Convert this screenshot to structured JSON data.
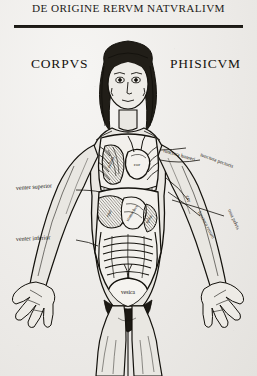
{
  "page": {
    "running_head": "DE ORIGINE RERVM NATVRALIVM",
    "title_left": "CORPVS",
    "title_right": "PHISICVM",
    "ink_color": "#17150f",
    "paper_color": "#efeeec"
  },
  "figure": {
    "name": "anatomical-figure"
  },
  "organ_labels": [
    {
      "id": "pulmo",
      "text": "pulmo",
      "x": 112,
      "y": 163,
      "rotate": -64,
      "size": 4.6
    },
    {
      "id": "cor",
      "text": "cor",
      "x": 133,
      "y": 166,
      "rotate": 0,
      "size": 5.0
    },
    {
      "id": "epar",
      "text": "epar",
      "x": 106,
      "y": 214,
      "rotate": -62,
      "size": 4.4
    },
    {
      "id": "stomachus",
      "text": "stomachus",
      "x": 124,
      "y": 216,
      "rotate": -58,
      "size": 4.3
    },
    {
      "id": "splen",
      "text": "splen",
      "x": 141,
      "y": 222,
      "rotate": -58,
      "size": 4.3
    },
    {
      "id": "vesica",
      "text": "vesica",
      "x": 130,
      "y": 292,
      "rotate": 0,
      "size": 5.4
    }
  ],
  "side_labels": [
    {
      "id": "venter-superior",
      "text": "venter superior",
      "x": 16,
      "y": 190,
      "rotate": -4,
      "size": 6.0,
      "align": "start"
    },
    {
      "id": "venter-inferior",
      "text": "venter inferior",
      "x": 16,
      "y": 241,
      "rotate": -3,
      "size": 6.0,
      "align": "start"
    },
    {
      "id": "iunctura-humeri-dextra",
      "text": "iunctura humeri",
      "x": 163,
      "y": 152,
      "rotate": 16,
      "size": 5.2,
      "align": "start"
    },
    {
      "id": "iunctura-pectoris",
      "text": "iunctura pectoris",
      "x": 206,
      "y": 158,
      "rotate": 20,
      "size": 5.2,
      "align": "start"
    },
    {
      "id": "cor-side",
      "text": "cor",
      "x": 188,
      "y": 198,
      "rotate": 74,
      "size": 5.2,
      "align": "start"
    },
    {
      "id": "iunctura-renum",
      "text": "iunctura renum",
      "x": 198,
      "y": 214,
      "rotate": 62,
      "size": 5.0,
      "align": "start"
    },
    {
      "id": "ossa-pelvis",
      "text": "ossa pelvis",
      "x": 230,
      "y": 212,
      "rotate": 66,
      "size": 5.0,
      "align": "start"
    }
  ]
}
